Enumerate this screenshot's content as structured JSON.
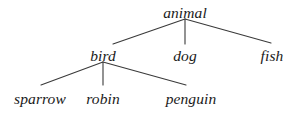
{
  "diagram": {
    "type": "tree-taxonomy",
    "background_color": "#ffffff",
    "edge_color": "#3a3a3a",
    "text_color": "#1a1a1a",
    "nodes": [
      {
        "id": "animal",
        "label": "animal",
        "level": 0,
        "x": 185,
        "y": 13
      },
      {
        "id": "bird",
        "label": "bird",
        "level": 1,
        "x": 103,
        "y": 56
      },
      {
        "id": "dog",
        "label": "dog",
        "level": 1,
        "x": 185,
        "y": 56
      },
      {
        "id": "fish",
        "label": "fish",
        "level": 1,
        "x": 272,
        "y": 56
      },
      {
        "id": "sparrow",
        "label": "sparrow",
        "level": 2,
        "x": 40,
        "y": 99
      },
      {
        "id": "robin",
        "label": "robin",
        "level": 2,
        "x": 103,
        "y": 99
      },
      {
        "id": "penguin",
        "label": "penguin",
        "level": 2,
        "x": 191,
        "y": 99
      }
    ],
    "edges": [
      {
        "from": "animal",
        "to": "bird",
        "x1": 185,
        "y1": 19,
        "x2": 113,
        "y2": 44
      },
      {
        "from": "animal",
        "to": "dog",
        "x1": 185,
        "y1": 19,
        "x2": 185,
        "y2": 44
      },
      {
        "from": "animal",
        "to": "fish",
        "x1": 185,
        "y1": 19,
        "x2": 271,
        "y2": 43
      },
      {
        "from": "bird",
        "to": "sparrow",
        "x1": 103,
        "y1": 62,
        "x2": 41,
        "y2": 85
      },
      {
        "from": "bird",
        "to": "robin",
        "x1": 103,
        "y1": 62,
        "x2": 103,
        "y2": 85
      },
      {
        "from": "bird",
        "to": "penguin",
        "x1": 103,
        "y1": 62,
        "x2": 186,
        "y2": 85
      }
    ]
  }
}
